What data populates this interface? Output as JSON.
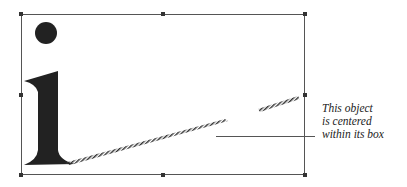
{
  "figure": {
    "object_glyph": "i",
    "caption_lines": [
      "This object",
      "is centered",
      "within its box"
    ],
    "colors": {
      "frame": "#555555",
      "glyph": "#222222",
      "handle": "#333333"
    }
  }
}
